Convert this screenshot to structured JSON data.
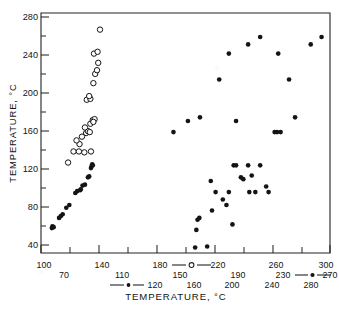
{
  "figure": {
    "background": "#ffffff",
    "ink": "#141414",
    "frame": {
      "x": 41,
      "y": 13,
      "width": 289,
      "height": 240
    }
  },
  "chart_data": {
    "type": "scatter",
    "title": "",
    "xlabel": "TEMPERATURE, °C",
    "ylabel": "TEMPERATURE, °C",
    "xlim": [
      90,
      330
    ],
    "ylim": [
      30,
      290
    ],
    "grid": false,
    "legend_position": "below-axis-inline",
    "y_axis": {
      "label": "TEMPERATURE, °C",
      "ticks": [
        40,
        80,
        120,
        160,
        200,
        240,
        280
      ],
      "tick_labels": [
        "40",
        "80",
        "120",
        "160",
        "200",
        "240",
        "280"
      ],
      "minor_step": 20,
      "min": 30,
      "max": 290
    },
    "x_axes": [
      {
        "row": 1,
        "series_marker": "open-circle",
        "marker_label": "open circle series scale",
        "tick_labels": [
          "100",
          "140",
          "180",
          "220",
          "260",
          "300"
        ],
        "values": [
          100,
          140,
          180,
          220,
          260,
          300
        ]
      },
      {
        "row": 2,
        "series_marker": "filled-dot",
        "marker_label": "filled dot series scale",
        "tick_labels": [
          "70",
          "110",
          "150",
          "190",
          "230",
          "270"
        ],
        "values": [
          70,
          110,
          150,
          190,
          230,
          270
        ]
      },
      {
        "row": 3,
        "series_marker": "small-filled-dot",
        "marker_label": "small filled dot series scale",
        "tick_labels": [
          "120",
          "160",
          "200",
          "240",
          "280"
        ],
        "values": [
          120,
          160,
          200,
          240,
          280
        ]
      }
    ],
    "series": [
      {
        "name": "open-circle-series",
        "marker": "open-circle",
        "marker_size": 4.2,
        "count": 26,
        "points": [
          [
            112.5,
            128
          ],
          [
            117.0,
            140
          ],
          [
            121.5,
            140
          ],
          [
            126.0,
            139
          ],
          [
            131.5,
            140
          ],
          [
            122.0,
            148
          ],
          [
            119.5,
            152
          ],
          [
            124.0,
            156
          ],
          [
            127.5,
            160
          ],
          [
            129.0,
            162
          ],
          [
            130.5,
            161
          ],
          [
            126.5,
            166
          ],
          [
            131.0,
            170
          ],
          [
            133.0,
            174
          ],
          [
            134.5,
            175
          ],
          [
            133.5,
            172
          ],
          [
            128.0,
            196
          ],
          [
            131.0,
            197
          ],
          [
            130.0,
            200
          ],
          [
            133.5,
            214
          ],
          [
            135.0,
            224
          ],
          [
            136.5,
            228
          ],
          [
            137.5,
            236
          ],
          [
            134.0,
            246
          ],
          [
            137.0,
            248
          ],
          [
            139.0,
            272
          ]
        ]
      },
      {
        "name": "filled-dot-series-low",
        "marker": "filled-dot",
        "marker_size": 3.6,
        "count": 24,
        "points": [
          [
            99.0,
            57
          ],
          [
            99.5,
            59
          ],
          [
            100.5,
            58
          ],
          [
            105.0,
            68
          ],
          [
            106.5,
            70
          ],
          [
            108.0,
            72
          ],
          [
            111.0,
            79
          ],
          [
            113.5,
            82
          ],
          [
            118.5,
            95
          ],
          [
            120.0,
            97
          ],
          [
            122.5,
            98
          ],
          [
            123.0,
            99
          ],
          [
            124.5,
            103
          ],
          [
            126.5,
            104
          ],
          [
            129.0,
            112
          ],
          [
            130.0,
            113
          ],
          [
            131.5,
            122
          ],
          [
            132.0,
            124
          ],
          [
            132.5,
            126
          ],
          [
            133.0,
            125
          ]
        ]
      },
      {
        "name": "filled-dot-series-upper-right",
        "marker": "filled-dot",
        "marker_size": 3.6,
        "count": 14,
        "points": [
          [
            200.0,
            161
          ],
          [
            212.0,
            173
          ],
          [
            222.0,
            177
          ],
          [
            246.0,
            246
          ],
          [
            252.0,
            173
          ],
          [
            262.0,
            256
          ],
          [
            272.0,
            264
          ],
          [
            287.0,
            246
          ],
          [
            296.0,
            218
          ],
          [
            301.0,
            177
          ],
          [
            314.0,
            256
          ],
          [
            323.0,
            264
          ],
          [
            238.0,
            218
          ],
          [
            284.0,
            161
          ]
        ]
      },
      {
        "name": "filled-dot-series-lower-right",
        "marker": "filled-dot",
        "marker_size": 3.6,
        "count": 25,
        "points": [
          [
            218.0,
            36
          ],
          [
            228.0,
            37
          ],
          [
            219.0,
            55
          ],
          [
            220.0,
            66
          ],
          [
            221.5,
            68
          ],
          [
            232.0,
            76
          ],
          [
            235.0,
            96
          ],
          [
            244.0,
            82
          ],
          [
            249.0,
            61
          ],
          [
            250.0,
            125
          ],
          [
            252.0,
            125
          ],
          [
            256.0,
            112
          ],
          [
            262.0,
            125
          ],
          [
            263.0,
            96
          ],
          [
            265.0,
            114
          ],
          [
            268.0,
            96
          ],
          [
            272.0,
            125
          ],
          [
            277.0,
            102
          ],
          [
            279.0,
            96
          ],
          [
            286.0,
            161
          ],
          [
            289.0,
            161
          ],
          [
            231.0,
            108
          ],
          [
            246.0,
            96
          ],
          [
            258.0,
            110
          ],
          [
            241.0,
            88
          ]
        ]
      }
    ]
  },
  "legend": {
    "entries": [
      {
        "marker": "open-circle",
        "row": 1
      },
      {
        "marker": "filled-dot",
        "row": 2
      },
      {
        "marker": "small-filled-dot",
        "row": 3
      }
    ]
  }
}
